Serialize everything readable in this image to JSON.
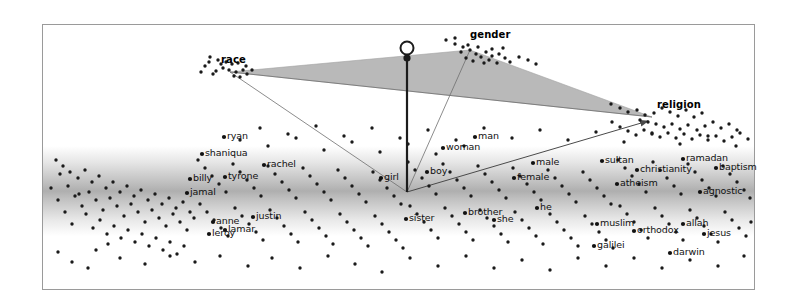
{
  "figure": {
    "type": "scatter",
    "background_color": "#ffffff",
    "border_color": "#9a9a9a",
    "plot_frame": {
      "x": 42,
      "y": 24,
      "width": 713,
      "height": 266
    }
  },
  "chart_data": {
    "type": "scatter",
    "title": "",
    "xlabel": "",
    "ylabel": "",
    "xlim": [
      0,
      796
    ],
    "ylim": [
      0,
      307
    ],
    "grid": false,
    "legend": null,
    "axis_vertices": [
      {
        "label": "race",
        "x": 230,
        "y": 72,
        "label_x": 221,
        "label_y": 55
      },
      {
        "label": "gender",
        "x": 470,
        "y": 50,
        "label_x": 470,
        "label_y": 30
      },
      {
        "label": "religion",
        "x": 652,
        "y": 117,
        "label_x": 657,
        "label_y": 100
      }
    ],
    "polygon_fill": "#b9b9b9",
    "polygon_points": "230,72 470,50 652,117",
    "stem": {
      "x": 407,
      "top_y": 58,
      "bottom_y": 192,
      "loop_y": 48,
      "color": "#1c1c1c"
    },
    "origin_point": {
      "x": 407,
      "y": 192
    },
    "arrow": {
      "from_x": 407,
      "from_y": 192,
      "to_x": 648,
      "to_y": 121
    },
    "band": {
      "y_top": 148,
      "y_bottom": 232,
      "peak_y": 186,
      "color": "#8d8d8d"
    },
    "word_labels": [
      {
        "text": "ryan",
        "x": 227,
        "y": 131
      },
      {
        "text": "shaniqua",
        "x": 205,
        "y": 148
      },
      {
        "text": "rachel",
        "x": 267,
        "y": 159
      },
      {
        "text": "billy",
        "x": 193,
        "y": 173
      },
      {
        "text": "tyrone",
        "x": 228,
        "y": 171
      },
      {
        "text": "jamal",
        "x": 190,
        "y": 187
      },
      {
        "text": "anne",
        "x": 216,
        "y": 216
      },
      {
        "text": "justin",
        "x": 256,
        "y": 211
      },
      {
        "text": "lamar",
        "x": 228,
        "y": 224
      },
      {
        "text": "leroy",
        "x": 212,
        "y": 228
      },
      {
        "text": "girl",
        "x": 384,
        "y": 172
      },
      {
        "text": "boy",
        "x": 430,
        "y": 166
      },
      {
        "text": "man",
        "x": 478,
        "y": 131
      },
      {
        "text": "woman",
        "x": 446,
        "y": 142
      },
      {
        "text": "male",
        "x": 536,
        "y": 157
      },
      {
        "text": "female",
        "x": 517,
        "y": 172
      },
      {
        "text": "sister",
        "x": 409,
        "y": 213
      },
      {
        "text": "brother",
        "x": 468,
        "y": 207
      },
      {
        "text": "she",
        "x": 497,
        "y": 214
      },
      {
        "text": "he",
        "x": 540,
        "y": 202
      },
      {
        "text": "sultan",
        "x": 605,
        "y": 155
      },
      {
        "text": "christianity",
        "x": 640,
        "y": 164
      },
      {
        "text": "ramadan",
        "x": 686,
        "y": 153
      },
      {
        "text": "baptism",
        "x": 719,
        "y": 162
      },
      {
        "text": "atheism",
        "x": 620,
        "y": 178
      },
      {
        "text": "agnostic",
        "x": 703,
        "y": 186
      },
      {
        "text": "muslim",
        "x": 600,
        "y": 218
      },
      {
        "text": "orthodox",
        "x": 637,
        "y": 225
      },
      {
        "text": "allah",
        "x": 686,
        "y": 218
      },
      {
        "text": "jesus",
        "x": 707,
        "y": 228
      },
      {
        "text": "galilei",
        "x": 597,
        "y": 240
      },
      {
        "text": "darwin",
        "x": 673,
        "y": 247
      }
    ],
    "points": [
      [
        210,
        57
      ],
      [
        218,
        60
      ],
      [
        226,
        62
      ],
      [
        232,
        64
      ],
      [
        238,
        63
      ],
      [
        223,
        68
      ],
      [
        229,
        70
      ],
      [
        236,
        72
      ],
      [
        243,
        70
      ],
      [
        213,
        74
      ],
      [
        205,
        66
      ],
      [
        247,
        74
      ],
      [
        252,
        70
      ],
      [
        240,
        77
      ],
      [
        234,
        76
      ],
      [
        221,
        64
      ],
      [
        216,
        71
      ],
      [
        209,
        62
      ],
      [
        201,
        72
      ],
      [
        246,
        66
      ],
      [
        455,
        44
      ],
      [
        463,
        47
      ],
      [
        470,
        50
      ],
      [
        478,
        47
      ],
      [
        486,
        52
      ],
      [
        492,
        49
      ],
      [
        499,
        54
      ],
      [
        466,
        58
      ],
      [
        473,
        61
      ],
      [
        481,
        57
      ],
      [
        489,
        60
      ],
      [
        497,
        63
      ],
      [
        505,
        58
      ],
      [
        461,
        52
      ],
      [
        476,
        54
      ],
      [
        484,
        63
      ],
      [
        492,
        56
      ],
      [
        468,
        45
      ],
      [
        503,
        48
      ],
      [
        510,
        62
      ],
      [
        519,
        57
      ],
      [
        528,
        60
      ],
      [
        536,
        64
      ],
      [
        446,
        40
      ],
      [
        455,
        38
      ],
      [
        611,
        104
      ],
      [
        620,
        108
      ],
      [
        628,
        112
      ],
      [
        637,
        110
      ],
      [
        645,
        115
      ],
      [
        654,
        113
      ],
      [
        662,
        108
      ],
      [
        670,
        112
      ],
      [
        678,
        116
      ],
      [
        686,
        110
      ],
      [
        694,
        117
      ],
      [
        702,
        113
      ],
      [
        640,
        120
      ],
      [
        648,
        122
      ],
      [
        656,
        124
      ],
      [
        664,
        127
      ],
      [
        672,
        124
      ],
      [
        680,
        129
      ],
      [
        688,
        125
      ],
      [
        697,
        130
      ],
      [
        705,
        126
      ],
      [
        713,
        122
      ],
      [
        721,
        128
      ],
      [
        729,
        124
      ],
      [
        737,
        130
      ],
      [
        612,
        122
      ],
      [
        620,
        127
      ],
      [
        628,
        131
      ],
      [
        636,
        135
      ],
      [
        644,
        130
      ],
      [
        652,
        133
      ],
      [
        660,
        137
      ],
      [
        668,
        133
      ],
      [
        676,
        138
      ],
      [
        684,
        134
      ],
      [
        692,
        139
      ],
      [
        700,
        135
      ],
      [
        708,
        140
      ],
      [
        716,
        136
      ],
      [
        724,
        141
      ],
      [
        732,
        137
      ],
      [
        740,
        133
      ],
      [
        748,
        139
      ],
      [
        56,
        160
      ],
      [
        63,
        166
      ],
      [
        70,
        172
      ],
      [
        78,
        178
      ],
      [
        85,
        170
      ],
      [
        92,
        182
      ],
      [
        99,
        176
      ],
      [
        106,
        188
      ],
      [
        113,
        182
      ],
      [
        120,
        192
      ],
      [
        127,
        186
      ],
      [
        134,
        196
      ],
      [
        141,
        190
      ],
      [
        148,
        200
      ],
      [
        155,
        194
      ],
      [
        162,
        204
      ],
      [
        169,
        198
      ],
      [
        176,
        208
      ],
      [
        183,
        202
      ],
      [
        190,
        212
      ],
      [
        60,
        174
      ],
      [
        68,
        186
      ],
      [
        75,
        196
      ],
      [
        82,
        206
      ],
      [
        89,
        192
      ],
      [
        96,
        200
      ],
      [
        103,
        210
      ],
      [
        110,
        198
      ],
      [
        117,
        206
      ],
      [
        124,
        216
      ],
      [
        131,
        204
      ],
      [
        138,
        212
      ],
      [
        145,
        222
      ],
      [
        152,
        210
      ],
      [
        159,
        218
      ],
      [
        166,
        226
      ],
      [
        173,
        214
      ],
      [
        180,
        222
      ],
      [
        187,
        230
      ],
      [
        194,
        218
      ],
      [
        51,
        188
      ],
      [
        58,
        200
      ],
      [
        65,
        212
      ],
      [
        72,
        224
      ],
      [
        79,
        194
      ],
      [
        86,
        214
      ],
      [
        93,
        228
      ],
      [
        100,
        220
      ],
      [
        107,
        234
      ],
      [
        114,
        226
      ],
      [
        121,
        238
      ],
      [
        128,
        230
      ],
      [
        135,
        242
      ],
      [
        142,
        234
      ],
      [
        149,
        246
      ],
      [
        156,
        238
      ],
      [
        163,
        250
      ],
      [
        170,
        242
      ],
      [
        177,
        254
      ],
      [
        184,
        246
      ],
      [
        198,
        160
      ],
      [
        205,
        168
      ],
      [
        212,
        176
      ],
      [
        219,
        184
      ],
      [
        226,
        192
      ],
      [
        233,
        164
      ],
      [
        240,
        172
      ],
      [
        247,
        180
      ],
      [
        254,
        188
      ],
      [
        261,
        196
      ],
      [
        268,
        166
      ],
      [
        275,
        174
      ],
      [
        282,
        182
      ],
      [
        289,
        190
      ],
      [
        296,
        198
      ],
      [
        303,
        168
      ],
      [
        310,
        176
      ],
      [
        317,
        184
      ],
      [
        324,
        192
      ],
      [
        331,
        200
      ],
      [
        338,
        170
      ],
      [
        345,
        178
      ],
      [
        352,
        186
      ],
      [
        359,
        194
      ],
      [
        366,
        202
      ],
      [
        373,
        172
      ],
      [
        380,
        180
      ],
      [
        387,
        188
      ],
      [
        394,
        196
      ],
      [
        401,
        204
      ],
      [
        200,
        204
      ],
      [
        207,
        212
      ],
      [
        214,
        220
      ],
      [
        221,
        228
      ],
      [
        228,
        236
      ],
      [
        235,
        208
      ],
      [
        242,
        216
      ],
      [
        249,
        224
      ],
      [
        256,
        232
      ],
      [
        263,
        240
      ],
      [
        270,
        210
      ],
      [
        277,
        218
      ],
      [
        284,
        226
      ],
      [
        291,
        234
      ],
      [
        298,
        242
      ],
      [
        305,
        212
      ],
      [
        312,
        220
      ],
      [
        319,
        228
      ],
      [
        326,
        236
      ],
      [
        333,
        244
      ],
      [
        340,
        214
      ],
      [
        347,
        222
      ],
      [
        354,
        230
      ],
      [
        361,
        238
      ],
      [
        368,
        246
      ],
      [
        375,
        216
      ],
      [
        382,
        224
      ],
      [
        389,
        232
      ],
      [
        396,
        240
      ],
      [
        403,
        248
      ],
      [
        408,
        162
      ],
      [
        415,
        170
      ],
      [
        422,
        178
      ],
      [
        429,
        186
      ],
      [
        436,
        194
      ],
      [
        443,
        164
      ],
      [
        450,
        172
      ],
      [
        457,
        180
      ],
      [
        464,
        188
      ],
      [
        471,
        196
      ],
      [
        478,
        166
      ],
      [
        485,
        174
      ],
      [
        492,
        182
      ],
      [
        499,
        190
      ],
      [
        506,
        198
      ],
      [
        513,
        168
      ],
      [
        520,
        176
      ],
      [
        527,
        184
      ],
      [
        534,
        192
      ],
      [
        541,
        200
      ],
      [
        548,
        170
      ],
      [
        555,
        178
      ],
      [
        562,
        186
      ],
      [
        569,
        194
      ],
      [
        576,
        202
      ],
      [
        583,
        172
      ],
      [
        590,
        180
      ],
      [
        597,
        188
      ],
      [
        604,
        196
      ],
      [
        611,
        204
      ],
      [
        410,
        206
      ],
      [
        417,
        214
      ],
      [
        424,
        222
      ],
      [
        431,
        230
      ],
      [
        438,
        238
      ],
      [
        445,
        208
      ],
      [
        452,
        216
      ],
      [
        459,
        224
      ],
      [
        466,
        232
      ],
      [
        473,
        240
      ],
      [
        480,
        210
      ],
      [
        487,
        218
      ],
      [
        494,
        226
      ],
      [
        501,
        234
      ],
      [
        508,
        242
      ],
      [
        515,
        212
      ],
      [
        522,
        220
      ],
      [
        529,
        228
      ],
      [
        536,
        236
      ],
      [
        543,
        244
      ],
      [
        550,
        214
      ],
      [
        557,
        222
      ],
      [
        564,
        230
      ],
      [
        571,
        238
      ],
      [
        578,
        246
      ],
      [
        585,
        216
      ],
      [
        592,
        224
      ],
      [
        599,
        232
      ],
      [
        606,
        240
      ],
      [
        613,
        248
      ],
      [
        618,
        160
      ],
      [
        625,
        168
      ],
      [
        632,
        176
      ],
      [
        639,
        184
      ],
      [
        646,
        192
      ],
      [
        653,
        162
      ],
      [
        660,
        170
      ],
      [
        667,
        178
      ],
      [
        674,
        186
      ],
      [
        681,
        194
      ],
      [
        688,
        164
      ],
      [
        695,
        172
      ],
      [
        702,
        180
      ],
      [
        709,
        188
      ],
      [
        716,
        196
      ],
      [
        723,
        166
      ],
      [
        730,
        174
      ],
      [
        737,
        182
      ],
      [
        744,
        190
      ],
      [
        750,
        198
      ],
      [
        620,
        206
      ],
      [
        627,
        214
      ],
      [
        634,
        222
      ],
      [
        641,
        230
      ],
      [
        648,
        238
      ],
      [
        655,
        208
      ],
      [
        662,
        216
      ],
      [
        669,
        224
      ],
      [
        676,
        232
      ],
      [
        683,
        240
      ],
      [
        690,
        210
      ],
      [
        697,
        218
      ],
      [
        704,
        226
      ],
      [
        711,
        234
      ],
      [
        718,
        242
      ],
      [
        725,
        212
      ],
      [
        732,
        220
      ],
      [
        739,
        228
      ],
      [
        746,
        236
      ],
      [
        751,
        222
      ],
      [
        120,
        258
      ],
      [
        145,
        264
      ],
      [
        170,
        256
      ],
      [
        195,
        262
      ],
      [
        220,
        256
      ],
      [
        248,
        266
      ],
      [
        272,
        258
      ],
      [
        300,
        268
      ],
      [
        328,
        256
      ],
      [
        355,
        264
      ],
      [
        382,
        272
      ],
      [
        410,
        258
      ],
      [
        438,
        266
      ],
      [
        466,
        256
      ],
      [
        494,
        268
      ],
      [
        522,
        260
      ],
      [
        550,
        270
      ],
      [
        578,
        258
      ],
      [
        606,
        266
      ],
      [
        634,
        258
      ],
      [
        662,
        268
      ],
      [
        690,
        260
      ],
      [
        718,
        266
      ],
      [
        744,
        256
      ],
      [
        96,
        250
      ],
      [
        72,
        262
      ],
      [
        58,
        252
      ],
      [
        88,
        268
      ],
      [
        108,
        244
      ],
      [
        240,
        140
      ],
      [
        268,
        146
      ],
      [
        296,
        138
      ],
      [
        324,
        150
      ],
      [
        352,
        142
      ],
      [
        380,
        152
      ],
      [
        408,
        144
      ],
      [
        436,
        154
      ],
      [
        464,
        146
      ],
      [
        260,
        128
      ],
      [
        288,
        134
      ],
      [
        316,
        126
      ],
      [
        344,
        136
      ],
      [
        372,
        128
      ],
      [
        400,
        138
      ],
      [
        428,
        130
      ],
      [
        456,
        140
      ],
      [
        484,
        128
      ],
      [
        512,
        138
      ],
      [
        540,
        130
      ],
      [
        568,
        140
      ],
      [
        596,
        132
      ],
      [
        624,
        142
      ],
      [
        652,
        134
      ],
      [
        680,
        144
      ],
      [
        708,
        136
      ],
      [
        736,
        146
      ]
    ]
  }
}
